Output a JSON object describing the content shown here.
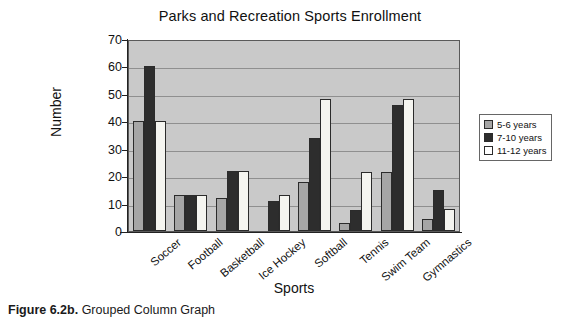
{
  "caption": {
    "figure_number": "Figure 6.2b.",
    "text": "Grouped Column Graph"
  },
  "chart_data": {
    "type": "bar",
    "title": "Parks and Recreation Sports Enrollment",
    "xlabel": "Sports",
    "ylabel": "Number",
    "ylim": [
      0,
      70
    ],
    "ytick_step": 10,
    "yticks": [
      "70",
      "60",
      "50",
      "40",
      "30",
      "20",
      "10",
      "0"
    ],
    "grid": true,
    "legend_position": "right",
    "plot_background": "#c9c9c9",
    "categories": [
      "Soccer",
      "Football",
      "Basketball",
      "Ice Hockey",
      "Softball",
      "Tennis",
      "Swim Team",
      "Gymnastics"
    ],
    "series": [
      {
        "name": "5-6 years",
        "color": "#a6a6a6",
        "values": [
          40,
          13,
          12,
          0,
          18,
          3,
          21.5,
          4.5
        ]
      },
      {
        "name": "7-10 years",
        "color": "#2d2d2d",
        "values": [
          60,
          13,
          22,
          11,
          34,
          7.5,
          46,
          15
        ]
      },
      {
        "name": "11-12 years",
        "color": "#ffffff",
        "values": [
          40,
          13,
          22,
          13,
          48,
          21.5,
          48,
          8
        ]
      }
    ]
  }
}
